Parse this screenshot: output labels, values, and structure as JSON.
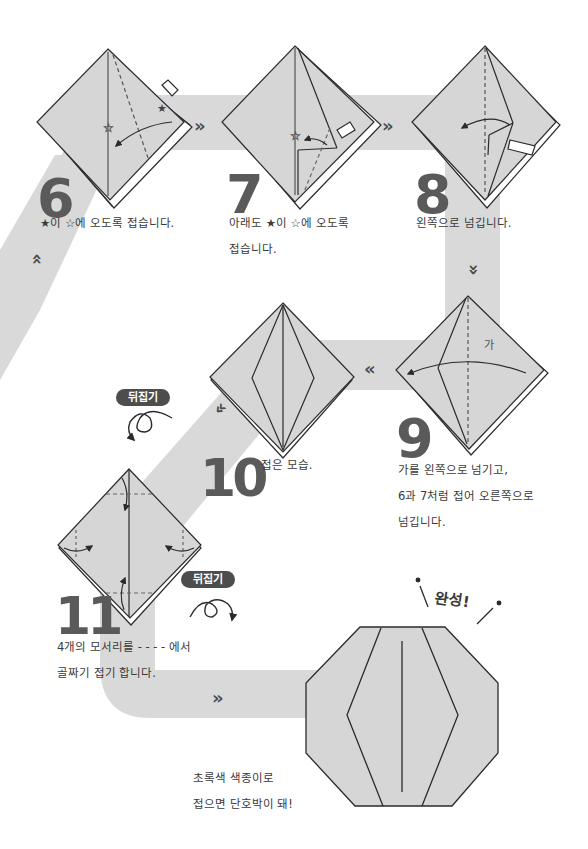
{
  "page": {
    "colors": {
      "path_band": "#d9d9d9",
      "paper_fill": "#d6d6d6",
      "line": "#2b2b2b",
      "step_number": "#5a5a5a",
      "badge_bg": "#4d4d4d",
      "badge_text": "#ffffff"
    }
  },
  "steps": [
    {
      "number": "6",
      "caption_lines": [
        "★이 ☆에 오도록 접습니다."
      ],
      "icons": [
        "folding-diagram",
        "fold-arrow",
        "push-arrow",
        "star-filled",
        "star-outline"
      ]
    },
    {
      "number": "7",
      "caption_lines": [
        "아래도 ★이 ☆에 오도록",
        "접습니다."
      ],
      "icons": [
        "folding-diagram",
        "fold-arrow",
        "push-arrow",
        "star-outline"
      ]
    },
    {
      "number": "8",
      "caption_lines": [
        "왼쪽으로 넘깁니다."
      ],
      "icons": [
        "folding-diagram",
        "flip-left-arrow",
        "push-arrow"
      ]
    },
    {
      "number": "9",
      "caption_lines": [
        "가를 왼쪽으로 넘기고,",
        "6과 7처럼 접어 오른쪽으로",
        "넘깁니다."
      ],
      "diagram_label": "가",
      "icons": [
        "folding-diagram",
        "flip-left-arrow"
      ]
    },
    {
      "number": "10",
      "caption_lines": [
        "접은 모습."
      ],
      "icons": [
        "folded-diagram"
      ]
    },
    {
      "number": "11",
      "caption_lines": [
        "4개의 모서리를 - - - - 에서",
        "골짜기 접기 합니다."
      ],
      "icons": [
        "folding-diagram",
        "corner-fold-arrows",
        "dashed-lines"
      ]
    }
  ],
  "flip_badges": [
    {
      "label": "뒤집기",
      "position": "above-step-11"
    },
    {
      "label": "뒤집기",
      "position": "after-step-11"
    }
  ],
  "flow_arrows": [
    {
      "glyph": "»",
      "between": "6-7"
    },
    {
      "glyph": "»",
      "between": "7-8"
    },
    {
      "glyph": "»",
      "between": "8-9",
      "direction": "down"
    },
    {
      "glyph": "«",
      "between": "9-10"
    },
    {
      "glyph": "«",
      "between": "10-11",
      "direction": "down-left"
    },
    {
      "glyph": "»",
      "between": "11-final"
    },
    {
      "glyph": "»",
      "between": "5-6",
      "direction": "up"
    }
  ],
  "final": {
    "exclamation": "완성!",
    "caption_lines": [
      "초록색 색종이로",
      "접으면 단호박이 돼!"
    ],
    "icons": [
      "pumpkin-octagon"
    ]
  }
}
